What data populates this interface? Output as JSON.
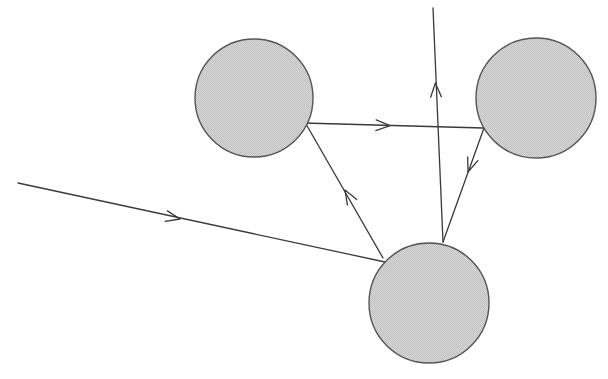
{
  "figure": {
    "canvas": {
      "width": 608,
      "height": 379,
      "background": "#ffffff"
    },
    "style": {
      "node_fill": "#cfcfcf",
      "node_stroke": "#555555",
      "node_stroke_width": 1.4,
      "edge_stroke": "#3a3a3a",
      "edge_stroke_width": 1.3,
      "arrow_stroke_width": 1.3
    },
    "nodes": [
      {
        "id": "node-top-left",
        "label": "top-left sphere",
        "cx": 254,
        "cy": 98,
        "r": 59
      },
      {
        "id": "node-top-right",
        "label": "top-right sphere",
        "cx": 536,
        "cy": 98,
        "r": 60
      },
      {
        "id": "node-bottom",
        "label": "bottom sphere",
        "cx": 429,
        "cy": 303,
        "r": 60
      }
    ],
    "edges": [
      {
        "id": "edge-incoming",
        "label": "incoming ray to bottom sphere",
        "from": "off-canvas-left",
        "to": "node-bottom",
        "path": "M 18,183 L 385,262",
        "arrow": {
          "x": 180,
          "y": 219,
          "angle": 12
        }
      },
      {
        "id": "edge-top-left-to-top-right",
        "label": "horizontal ray top-left sphere to top-right sphere",
        "from": "node-top-left",
        "to": "node-top-right",
        "path": "M 303,123 L 483,128",
        "arrow": {
          "x": 390,
          "y": 125.6,
          "angle": 1.6
        }
      },
      {
        "id": "edge-bottom-upward",
        "label": "upward ray leaving bottom sphere",
        "from": "node-bottom",
        "to": "off-canvas-top",
        "path": "M 443,242 L 433,8",
        "arrow": {
          "x": 435.4,
          "y": 83,
          "angle": -92.4
        }
      },
      {
        "id": "edge-top-right-to-bottom",
        "label": "diagonal ray top-right sphere to bottom sphere",
        "from": "node-top-right",
        "to": "node-bottom",
        "path": "M 484,128 L 443,242",
        "arrow": {
          "x": 468,
          "y": 172,
          "angle": 109.8
        }
      },
      {
        "id": "edge-bottom-to-top-left",
        "label": "diagonal ray bottom sphere to top-left sphere",
        "from": "node-bottom",
        "to": "node-top-left",
        "path": "M 383,258 L 306,124",
        "arrow": {
          "x": 345,
          "y": 190,
          "angle": -120.1
        }
      }
    ]
  }
}
